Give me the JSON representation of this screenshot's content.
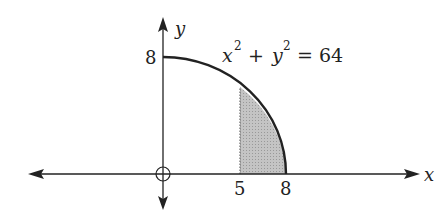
{
  "diagram": {
    "type": "quarter-circle-region",
    "axes": {
      "x_label": "x",
      "y_label": "y",
      "origin_marker": "circle-with-cross"
    },
    "curve": {
      "equation_lhs_x": "x",
      "equation_lhs_y": "y",
      "exponent": "2",
      "plus": "+",
      "equals": "= 64",
      "radius": 8
    },
    "ticks": {
      "y_tick_label": "8",
      "x_tick_5": "5",
      "x_tick_8": "8"
    },
    "shaded_region": {
      "x_from": 5,
      "x_to": 8,
      "fill_color": "#b8b8b8",
      "boundary_left": "dotted"
    },
    "colors": {
      "line": "#222222",
      "shade": "#b8b8b8",
      "background": "#ffffff"
    }
  }
}
